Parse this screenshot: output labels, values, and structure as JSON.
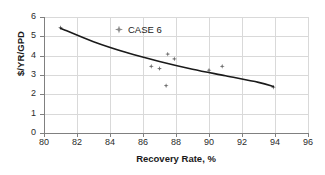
{
  "chart_data": {
    "type": "scatter",
    "title": "",
    "xlabel": "Recovery Rate, %",
    "ylabel": "$/YR/GPD",
    "xlim": [
      80,
      96
    ],
    "ylim": [
      0,
      6
    ],
    "xticks": [
      80,
      82,
      84,
      86,
      88,
      90,
      92,
      94,
      96
    ],
    "yticks": [
      0,
      1,
      2,
      3,
      4,
      5,
      6
    ],
    "grid": true,
    "legend_position": "inside-top-center",
    "series": [
      {
        "name": "CASE 6",
        "marker": "diamond",
        "color": "#6e6e6e",
        "points": [
          {
            "x": 81.0,
            "y": 5.45
          },
          {
            "x": 86.5,
            "y": 3.45
          },
          {
            "x": 87.0,
            "y": 3.33
          },
          {
            "x": 87.4,
            "y": 2.45
          },
          {
            "x": 87.5,
            "y": 4.08
          },
          {
            "x": 87.9,
            "y": 3.83
          },
          {
            "x": 90.0,
            "y": 3.25
          },
          {
            "x": 90.8,
            "y": 3.45
          },
          {
            "x": 93.9,
            "y": 2.37
          }
        ]
      },
      {
        "name": "trend",
        "type": "line",
        "color": "#1a1a1a",
        "points": [
          {
            "x": 81.0,
            "y": 5.42
          },
          {
            "x": 83.0,
            "y": 4.72
          },
          {
            "x": 85.0,
            "y": 4.16
          },
          {
            "x": 87.0,
            "y": 3.7
          },
          {
            "x": 89.0,
            "y": 3.3
          },
          {
            "x": 91.0,
            "y": 2.96
          },
          {
            "x": 93.0,
            "y": 2.62
          },
          {
            "x": 93.9,
            "y": 2.4
          }
        ]
      }
    ]
  },
  "legend": {
    "label": "CASE 6",
    "marker_name": "diamond-marker-icon"
  },
  "axes": {
    "x_title": "Recovery Rate, %",
    "y_title": "$/YR/GPD",
    "x_tick_labels": [
      "80",
      "82",
      "84",
      "86",
      "88",
      "90",
      "92",
      "94",
      "96"
    ],
    "y_tick_labels": [
      "0",
      "1",
      "2",
      "3",
      "4",
      "5",
      "6"
    ]
  },
  "colors": {
    "marker": "#6e6e6e",
    "trend_line": "#1a1a1a",
    "grid": "#d9d9d9",
    "axis": "#808080",
    "text": "#1a1a1a",
    "background": "#ffffff"
  }
}
